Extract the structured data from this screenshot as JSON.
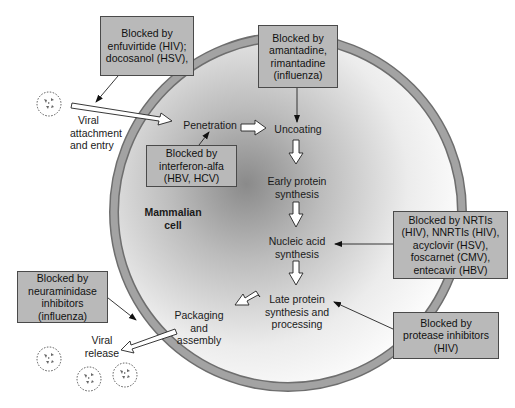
{
  "colors": {
    "background": "#ffffff",
    "box_fill": "#b9b9b9",
    "box_border": "#4a4a4a",
    "membrane": "#9b9b9b",
    "membrane_edge": "#6e6e6e",
    "cell_center_shade": "#8c8c8c",
    "text": "#1a1a1a"
  },
  "cell": {
    "label_line1": "Mammalian",
    "label_line2": "cell"
  },
  "steps": {
    "viral_attachment": [
      "Viral",
      "attachment",
      "and entry"
    ],
    "penetration": "Penetration",
    "uncoating": "Uncoating",
    "early_protein": [
      "Early protein",
      "synthesis"
    ],
    "nucleic_acid": [
      "Nucleic acid",
      "synthesis"
    ],
    "late_protein": [
      "Late protein",
      "synthesis and",
      "processing"
    ],
    "packaging": [
      "Packaging",
      "and",
      "assembly"
    ],
    "viral_release": [
      "Viral",
      "release"
    ]
  },
  "blockers": {
    "entry": [
      "Blocked by",
      "enfuvirtide (HIV);",
      "docosanol (HSV),"
    ],
    "uncoating": [
      "Blocked by",
      "amantadine,",
      "rimantadine",
      "(influenza)"
    ],
    "penetration": [
      "Blocked by",
      "interferon-alfa",
      "(HBV, HCV)"
    ],
    "nucleic_acid": [
      "Blocked by NRTIs",
      "(HIV), NNRTIs (HIV),",
      "acyclovir (HSV),",
      "foscarnet (CMV),",
      "entecavir (HBV)"
    ],
    "release": [
      "Blocked by",
      "neuraminidase",
      "inhibitors",
      "(influenza)"
    ],
    "late_protein": [
      "Blocked by",
      "protease inhibitors",
      "(HIV)"
    ]
  },
  "icons": {
    "virus_particle": "virus-particle-icon",
    "flow_arrow": "hollow-arrow-icon",
    "pointer_arrow": "thin-arrow-icon"
  }
}
